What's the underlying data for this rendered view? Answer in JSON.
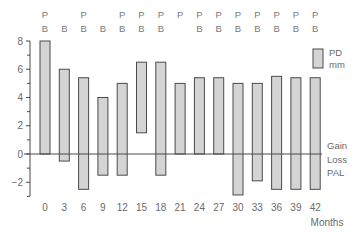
{
  "chart_data": {
    "type": "bar",
    "subtype": "floating-range-bar",
    "title": "",
    "xlabel": "Months",
    "ylabel": "",
    "ylim": [
      -3,
      8
    ],
    "yticks": [
      -2,
      0,
      2,
      4,
      6,
      8
    ],
    "ytick_labels": [
      "−2",
      "0",
      "2",
      "4",
      "6",
      "8"
    ],
    "grid": false,
    "categories": [
      "0",
      "3",
      "6",
      "9",
      "12",
      "15",
      "18",
      "21",
      "24",
      "27",
      "30",
      "33",
      "36",
      "39",
      "42"
    ],
    "series": [
      {
        "name": "PD mm (top of bar)",
        "values": [
          8.0,
          6.0,
          5.4,
          4.0,
          5.0,
          6.5,
          6.5,
          5.0,
          5.4,
          5.4,
          5.0,
          5.0,
          5.5,
          5.4,
          5.4
        ]
      },
      {
        "name": "PAL (bottom of bar; Gain > 0, Loss < 0)",
        "values": [
          0.0,
          -0.5,
          -2.5,
          -1.5,
          -1.5,
          1.5,
          -1.5,
          0.0,
          0.0,
          0.0,
          -2.9,
          -1.9,
          -2.5,
          -2.5,
          -2.5
        ]
      }
    ],
    "top_markers": [
      {
        "P": true,
        "B": true
      },
      {
        "P": false,
        "B": true
      },
      {
        "P": true,
        "B": true
      },
      {
        "P": false,
        "B": true
      },
      {
        "P": true,
        "B": true
      },
      {
        "P": true,
        "B": true
      },
      {
        "P": true,
        "B": true
      },
      {
        "P": true,
        "B": false
      },
      {
        "P": true,
        "B": true
      },
      {
        "P": true,
        "B": true
      },
      {
        "P": true,
        "B": true
      },
      {
        "P": true,
        "B": true
      },
      {
        "P": true,
        "B": true
      },
      {
        "P": true,
        "B": true
      },
      {
        "P": true,
        "B": true
      }
    ],
    "legend": {
      "position": "right",
      "box_label_line1": "PD",
      "box_label_line2": "mm",
      "gain_label": "Gain",
      "loss_label": "Loss",
      "pal_label": "PAL"
    },
    "marker_letters": {
      "P": "P",
      "B": "B"
    },
    "colors": {
      "bar_fill": "#d4d4d4",
      "bar_stroke": "#4a4a4a",
      "axis": "#4a4a4a",
      "text": "#6a6a6a"
    }
  }
}
